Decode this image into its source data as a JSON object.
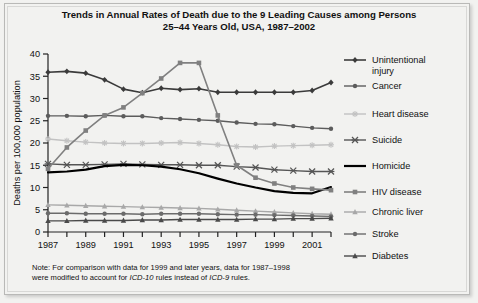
{
  "figure": {
    "title_line1": "Trends in Annual Rates of Death due to the 9 Leading Causes among Persons",
    "title_line2": "25–44 Years Old, USA, 1987–2002",
    "note_prefix": "Note: For comparison with data for 1999 and later years, data for 1987–1998",
    "note_line2_a": "were modified to account for ",
    "note_line2_icd10": "ICD-10",
    "note_line2_b": " rules instead of ",
    "note_line2_icd9": "ICD-9",
    "note_line2_c": " rules.",
    "background": "#f2f2f0",
    "frame_color": "#b9b9b7"
  },
  "chart_data": {
    "type": "line",
    "xlabel": "",
    "ylabel": "Deaths per 100,000 population",
    "xlim": [
      1987,
      2002
    ],
    "ylim": [
      0,
      40
    ],
    "yticks": [
      0,
      5,
      10,
      15,
      20,
      25,
      30,
      35,
      40
    ],
    "xticks": [
      1987,
      1988,
      1989,
      1990,
      1991,
      1992,
      1993,
      1994,
      1995,
      1996,
      1997,
      1998,
      1999,
      2000,
      2001,
      2002
    ],
    "xticklabels": [
      "1987",
      "",
      "1989",
      "",
      "1991",
      "",
      "1993",
      "",
      "1995",
      "",
      "1997",
      "",
      "1999",
      "",
      "2001",
      ""
    ],
    "grid": false,
    "legend_position": "right",
    "x": [
      1987,
      1988,
      1989,
      1990,
      1991,
      1992,
      1993,
      1994,
      1995,
      1996,
      1997,
      1998,
      1999,
      2000,
      2001,
      2002
    ],
    "series": [
      {
        "name": "Unintentional injury",
        "label": "Unintentional\ninjury",
        "color": "#3b3b3b",
        "marker": "diamond",
        "width": 1.6,
        "values": [
          35.9,
          36.1,
          35.7,
          34.2,
          32.1,
          31.3,
          32.3,
          32.0,
          32.2,
          31.4,
          31.4,
          31.4,
          31.4,
          31.4,
          31.8,
          33.6
        ]
      },
      {
        "name": "Cancer",
        "label": "Cancer",
        "color": "#5c5c5c",
        "marker": "circle",
        "width": 1.4,
        "values": [
          26.1,
          26.1,
          26.0,
          26.2,
          26.0,
          26.0,
          25.6,
          25.4,
          25.2,
          25.0,
          24.6,
          24.3,
          24.2,
          23.8,
          23.4,
          23.2
        ]
      },
      {
        "name": "Heart disease",
        "label": "Heart disease",
        "color": "#c2c2c2",
        "marker": "star",
        "width": 1.4,
        "values": [
          20.9,
          20.5,
          20.2,
          20.0,
          19.9,
          19.9,
          20.0,
          20.1,
          19.9,
          19.6,
          19.2,
          19.1,
          19.3,
          19.4,
          19.5,
          19.6
        ]
      },
      {
        "name": "Suicide",
        "label": "Suicide",
        "color": "#555555",
        "marker": "x-cross",
        "width": 1.4,
        "values": [
          15.3,
          15.1,
          15.1,
          15.2,
          15.3,
          15.2,
          15.1,
          15.1,
          15.0,
          15.0,
          14.7,
          14.5,
          14.0,
          13.8,
          13.6,
          13.6
        ]
      },
      {
        "name": "Homicide",
        "label": "Homicide",
        "color": "#000000",
        "marker": "none",
        "width": 2.2,
        "values": [
          13.4,
          13.6,
          14.0,
          14.8,
          15.1,
          15.0,
          14.7,
          14.1,
          13.2,
          12.0,
          10.9,
          10.0,
          9.2,
          8.8,
          8.7,
          10.1
        ]
      },
      {
        "name": "HIV disease",
        "label": "HIV disease",
        "color": "#808080",
        "marker": "square",
        "width": 1.6,
        "values": [
          14.2,
          19.0,
          22.8,
          26.2,
          28.0,
          31.2,
          34.5,
          38.0,
          38.0,
          26.2,
          15.0,
          12.2,
          10.9,
          10.0,
          9.7,
          9.4
        ]
      },
      {
        "name": "Chronic liver",
        "label": "Chronic liver",
        "color": "#a8a8a8",
        "marker": "triangle",
        "width": 1.4,
        "values": [
          6.1,
          6.0,
          5.9,
          5.8,
          5.7,
          5.6,
          5.5,
          5.4,
          5.3,
          5.1,
          4.9,
          4.7,
          4.5,
          4.3,
          4.1,
          4.0
        ]
      },
      {
        "name": "Stroke",
        "label": "Stroke",
        "color": "#6b6b6b",
        "marker": "circle",
        "width": 1.4,
        "values": [
          4.2,
          4.2,
          4.1,
          4.1,
          4.1,
          4.0,
          4.1,
          4.1,
          4.1,
          4.0,
          3.9,
          3.9,
          3.8,
          3.7,
          3.6,
          3.5
        ]
      },
      {
        "name": "Diabetes",
        "label": "Diabetes",
        "color": "#4a4a4a",
        "marker": "triangle",
        "width": 1.4,
        "values": [
          2.5,
          2.5,
          2.6,
          2.6,
          2.6,
          2.7,
          2.7,
          2.8,
          2.8,
          2.8,
          2.8,
          2.9,
          2.9,
          3.0,
          3.0,
          3.1
        ]
      }
    ]
  },
  "legend": {
    "entries": [
      {
        "label": "Unintentional injury",
        "lines": [
          "Unintentional",
          "injury"
        ]
      },
      {
        "label": "Cancer",
        "lines": [
          "Cancer"
        ]
      },
      {
        "label": "Heart disease",
        "lines": [
          "Heart disease"
        ]
      },
      {
        "label": "Suicide",
        "lines": [
          "Suicide"
        ]
      },
      {
        "label": "Homicide",
        "lines": [
          "Homicide"
        ]
      },
      {
        "label": "HIV disease",
        "lines": [
          "HIV disease"
        ]
      },
      {
        "label": "Chronic liver",
        "lines": [
          "Chronic liver"
        ]
      },
      {
        "label": "Stroke",
        "lines": [
          "Stroke"
        ]
      },
      {
        "label": "Diabetes",
        "lines": [
          "Diabetes"
        ]
      }
    ]
  }
}
